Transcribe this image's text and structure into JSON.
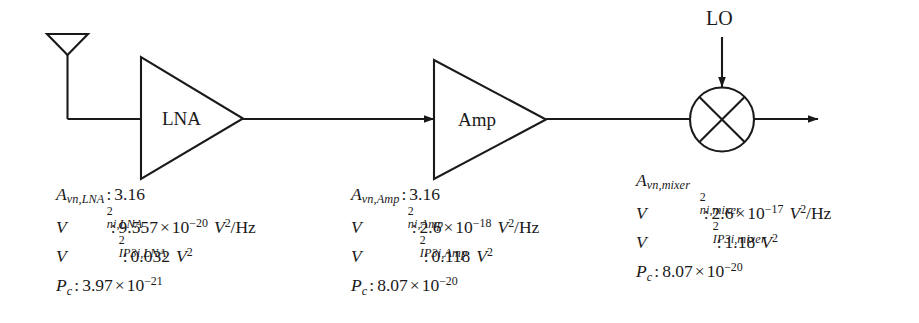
{
  "blocks": {
    "antenna": {
      "name": "antenna"
    },
    "lna": {
      "label": "LNA"
    },
    "amp": {
      "label": "Amp"
    },
    "mixer": {
      "name": "mixer"
    },
    "lo": {
      "label": "LO"
    }
  },
  "params": {
    "lna": {
      "gain": {
        "symbol": "A",
        "sub": "vn,LNA",
        "value": "3.16"
      },
      "noise": {
        "symbol": "V",
        "sup": "2",
        "sub": "ni,LNA",
        "mantissa": "9.557",
        "times": "×",
        "base": "10",
        "exponent": "−20",
        "unit_sym": "V",
        "unit_sup": "2",
        "unit_rest": "/Hz"
      },
      "ip3": {
        "symbol": "V",
        "sup": "2",
        "sub": "IP3i,LNA",
        "value": "0.032",
        "unit_sym": "V",
        "unit_sup": "2"
      },
      "pc": {
        "symbol": "P",
        "sub": "c",
        "mantissa": "3.97",
        "times": "×",
        "base": "10",
        "exponent": "−21"
      }
    },
    "amp": {
      "gain": {
        "symbol": "A",
        "sub": "vn,Amp",
        "value": "3.16"
      },
      "noise": {
        "symbol": "V",
        "sup": "2",
        "sub": "ni,Amp",
        "mantissa": "2.6",
        "times": "×",
        "base": "10",
        "exponent": "−18",
        "unit_sym": "V",
        "unit_sup": "2",
        "unit_rest": "/Hz"
      },
      "ip3": {
        "symbol": "V",
        "sup": "2",
        "sub": "IP3i,Amp",
        "value": "0.118",
        "unit_sym": "V",
        "unit_sup": "2"
      },
      "pc": {
        "symbol": "P",
        "sub": "c",
        "mantissa": "8.07",
        "times": "×",
        "base": "10",
        "exponent": "−20"
      }
    },
    "mixer": {
      "gain": {
        "symbol": "A",
        "sub": "vn,mixer",
        "value": ""
      },
      "noise": {
        "symbol": "V",
        "sup": "2",
        "sub": "ni,mixer",
        "mantissa": "2.6",
        "times": "×",
        "base": "10",
        "exponent": "−17",
        "unit_sym": "V",
        "unit_sup": "2",
        "unit_rest": "/Hz"
      },
      "ip3": {
        "symbol": "V",
        "sup": "2",
        "sub": "IP3i,mixer",
        "value": "1.18",
        "unit_sym": "V",
        "unit_sup": "2"
      },
      "pc": {
        "symbol": "P",
        "sub": "c",
        "mantissa": "8.07",
        "times": "×",
        "base": "10",
        "exponent": "−20"
      }
    }
  },
  "colors": {
    "stroke": "#1a1a1a",
    "background": "#ffffff"
  }
}
